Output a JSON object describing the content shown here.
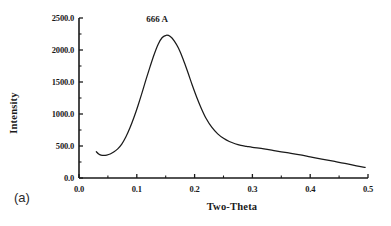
{
  "chart_data": {
    "type": "line",
    "title": "",
    "xlabel": "Two-Theta",
    "ylabel": "Intensity",
    "xlim": [
      0.0,
      0.5
    ],
    "ylim": [
      0.0,
      2500.0
    ],
    "grid": false,
    "legend": null,
    "panel_label": "(a)",
    "annotations": [
      {
        "text": "666 A",
        "x": 0.135,
        "y": 2430
      }
    ],
    "xticks": [
      0.0,
      0.1,
      0.2,
      0.3,
      0.4,
      0.5
    ],
    "xtick_labels": [
      "0.0",
      "0.1",
      "0.2",
      "0.3",
      "0.4",
      "0.5"
    ],
    "xminor_ticks": [
      0.05,
      0.15,
      0.25,
      0.35,
      0.45
    ],
    "yticks": [
      0.0,
      500.0,
      1000.0,
      1500.0,
      2000.0,
      2500.0
    ],
    "ytick_labels": [
      "0.0",
      "500.0",
      "1000.0",
      "1500.0",
      "2000.0",
      "2500.0"
    ],
    "series": [
      {
        "name": "Intensity",
        "color": "#1a1a1a",
        "x": [
          0.03,
          0.034,
          0.038,
          0.043,
          0.048,
          0.054,
          0.06,
          0.067,
          0.074,
          0.081,
          0.088,
          0.095,
          0.102,
          0.109,
          0.116,
          0.123,
          0.13,
          0.137,
          0.144,
          0.151,
          0.158,
          0.165,
          0.172,
          0.18,
          0.188,
          0.196,
          0.204,
          0.212,
          0.22,
          0.23,
          0.24,
          0.25,
          0.26,
          0.27,
          0.28,
          0.29,
          0.3,
          0.32,
          0.34,
          0.36,
          0.38,
          0.4,
          0.42,
          0.44,
          0.46,
          0.48,
          0.495
        ],
        "y": [
          410,
          375,
          358,
          352,
          358,
          375,
          405,
          455,
          530,
          640,
          780,
          945,
          1130,
          1330,
          1540,
          1740,
          1930,
          2090,
          2195,
          2230,
          2210,
          2140,
          2030,
          1860,
          1660,
          1450,
          1255,
          1080,
          930,
          790,
          690,
          620,
          570,
          535,
          510,
          495,
          480,
          455,
          425,
          395,
          365,
          330,
          295,
          262,
          228,
          190,
          165
        ]
      }
    ]
  },
  "axes": {
    "pixel_origin_x": 79,
    "pixel_origin_y": 178,
    "pixel_right_x": 368,
    "pixel_top_y": 18
  }
}
